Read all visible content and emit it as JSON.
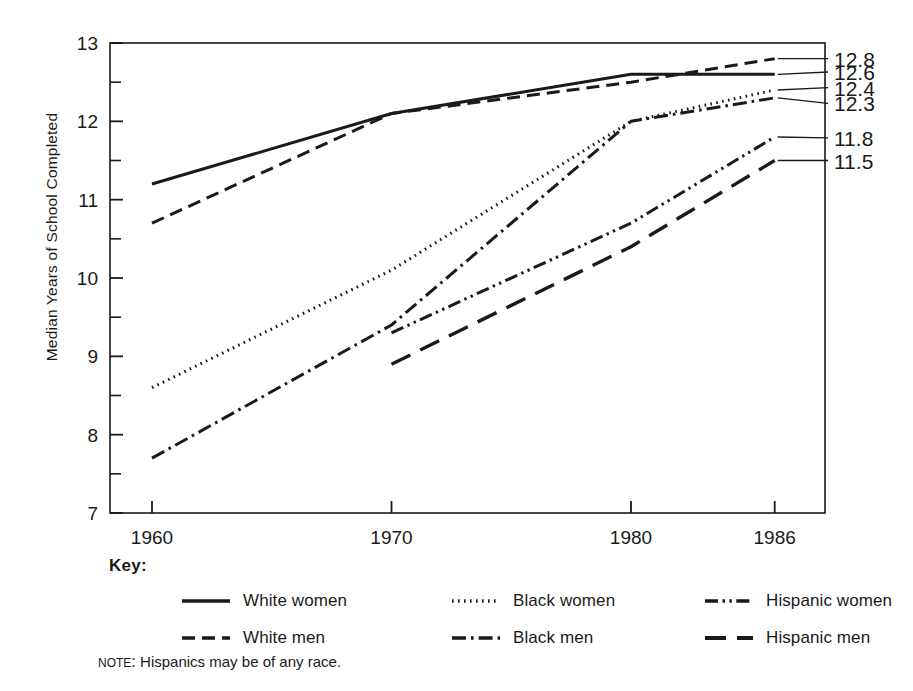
{
  "chart_data": {
    "type": "line",
    "title": "",
    "xlabel": "",
    "ylabel": "Median Years of School Completed",
    "x": [
      1960,
      1970,
      1980,
      1986
    ],
    "xtick_labels": [
      "1960",
      "1970",
      "1980",
      "1986"
    ],
    "ytick_labels": [
      "7",
      "8",
      "9",
      "10",
      "11",
      "12",
      "13"
    ],
    "yticks": [
      7,
      8,
      9,
      10,
      11,
      12,
      13
    ],
    "yminor_step": 0.5,
    "ylim": [
      7,
      13
    ],
    "xlim": [
      1958,
      1988
    ],
    "grid": false,
    "legend_position": "below-plot",
    "series": [
      {
        "name": "White women",
        "style": "solid",
        "x": [
          1960,
          1970,
          1980,
          1986
        ],
        "values": [
          11.2,
          12.1,
          12.6,
          12.6
        ],
        "end_label": "12.6"
      },
      {
        "name": "White men",
        "style": "dashed",
        "x": [
          1960,
          1970,
          1980,
          1986
        ],
        "values": [
          10.7,
          12.1,
          12.5,
          12.8
        ],
        "end_label": "12.8"
      },
      {
        "name": "Black women",
        "style": "dotted",
        "x": [
          1960,
          1970,
          1980,
          1986
        ],
        "values": [
          8.6,
          10.1,
          12.0,
          12.4
        ],
        "end_label": "12.4"
      },
      {
        "name": "Black men",
        "style": "dash-dot",
        "x": [
          1960,
          1970,
          1980,
          1986
        ],
        "values": [
          7.7,
          9.4,
          12.0,
          12.3
        ],
        "end_label": "12.3"
      },
      {
        "name": "Hispanic women",
        "style": "dash-dot-dot",
        "x": [
          1970,
          1980,
          1986
        ],
        "values": [
          9.3,
          10.7,
          11.8
        ],
        "end_label": "11.8"
      },
      {
        "name": "Hispanic men",
        "style": "long-dash",
        "x": [
          1970,
          1980,
          1986
        ],
        "values": [
          8.9,
          10.4,
          11.5
        ],
        "end_label": "11.5"
      }
    ],
    "end_labels": [
      "12.8",
      "12.6",
      "12.4",
      "12.3",
      "11.8",
      "11.5"
    ],
    "line_color": "#1a1a1a"
  },
  "key": {
    "title": "Key:",
    "entries": [
      {
        "label": "White women",
        "style": "solid"
      },
      {
        "label": "Black women",
        "style": "dotted"
      },
      {
        "label": "Hispanic women",
        "style": "dash-dot-dot"
      },
      {
        "label": "White men",
        "style": "dashed"
      },
      {
        "label": "Black men",
        "style": "dash-dot"
      },
      {
        "label": "Hispanic men",
        "style": "long-dash"
      }
    ]
  },
  "note": {
    "kicker": "Note:",
    "text": "Hispanics may be of any race."
  }
}
